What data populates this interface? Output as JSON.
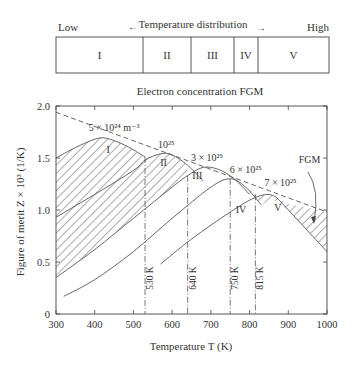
{
  "top_bar": {
    "low_label": "Low",
    "high_label": "High",
    "title": "Temperature distribution",
    "left_arrow": "←",
    "right_arrow": "→",
    "segments": [
      {
        "label": "I",
        "x0": 56,
        "x1": 143
      },
      {
        "label": "II",
        "x0": 143,
        "x1": 191
      },
      {
        "label": "III",
        "x0": 191,
        "x1": 234
      },
      {
        "label": "IV",
        "x0": 234,
        "x1": 258
      },
      {
        "label": "V",
        "x0": 258,
        "x1": 329
      }
    ]
  },
  "subtitle": "Electron concentration FGM",
  "chart_data": {
    "type": "line",
    "title": "Electron concentration FGM",
    "xlabel": "Temperature T (K)",
    "ylabel": "Figure of merit Z × 10³ (1/K)",
    "xlim": [
      300,
      1000
    ],
    "ylim": [
      0,
      2.0
    ],
    "x_ticks": [
      300,
      400,
      500,
      600,
      700,
      800,
      900,
      1000
    ],
    "y_ticks": [
      0,
      0.5,
      1.0,
      1.5,
      2.0
    ],
    "y_tick_labels": [
      "0",
      "0.5",
      "1.0",
      "1.5",
      "2.0"
    ],
    "grid": false,
    "series": [
      {
        "name": "5×10^24 m^-3",
        "segment": "I",
        "x": [
          300,
          350,
          400,
          430,
          480,
          530
        ],
        "y": [
          1.5,
          1.6,
          1.68,
          1.69,
          1.62,
          1.51
        ]
      },
      {
        "name": "10^25",
        "segment": "II",
        "x": [
          300,
          400,
          500,
          530,
          570,
          600,
          640,
          680
        ],
        "y": [
          0.93,
          1.15,
          1.38,
          1.48,
          1.54,
          1.53,
          1.43,
          1.28
        ]
      },
      {
        "name": "3×10^25",
        "segment": "III",
        "x": [
          300,
          400,
          500,
          600,
          640,
          680,
          720,
          760,
          800
        ],
        "y": [
          0.35,
          0.62,
          0.92,
          1.22,
          1.33,
          1.41,
          1.39,
          1.3,
          1.15
        ]
      },
      {
        "name": "6×10^25",
        "segment": "IV",
        "x": [
          320,
          400,
          500,
          600,
          700,
          750,
          790,
          830
        ],
        "y": [
          0.17,
          0.33,
          0.6,
          0.92,
          1.22,
          1.3,
          1.22,
          1.05
        ]
      },
      {
        "name": "7×10^25",
        "segment": "V",
        "x": [
          570,
          650,
          750,
          815,
          860,
          900,
          950,
          1000
        ],
        "y": [
          0.48,
          0.72,
          0.98,
          1.12,
          1.14,
          1.0,
          0.8,
          0.6
        ]
      },
      {
        "name": "FGM",
        "style": "dashed",
        "x": [
          300,
          1000
        ],
        "y": [
          1.94,
          0.98
        ]
      }
    ],
    "boundaries": [
      {
        "label": "530 K",
        "x": 530
      },
      {
        "label": "640 K",
        "x": 640
      },
      {
        "label": "750 K",
        "x": 750
      },
      {
        "label": "815 K",
        "x": 815
      }
    ],
    "annotations": [
      {
        "text": "5 × 10²⁴ m⁻³",
        "x": 450,
        "y": 1.76
      },
      {
        "text": "10²⁵",
        "x": 585,
        "y": 1.6
      },
      {
        "text": "3 × 10²⁵",
        "x": 690,
        "y": 1.47
      },
      {
        "text": "6 × 10²⁵",
        "x": 790,
        "y": 1.36
      },
      {
        "text": "7 × 10²⁵",
        "x": 880,
        "y": 1.23
      },
      {
        "text": "FGM",
        "x": 955,
        "y": 1.45
      },
      {
        "text": "I",
        "x": 435,
        "y": 1.55
      },
      {
        "text": "II",
        "x": 578,
        "y": 1.42
      },
      {
        "text": "III",
        "x": 665,
        "y": 1.3
      },
      {
        "text": "IV",
        "x": 778,
        "y": 0.97
      },
      {
        "text": "V",
        "x": 873,
        "y": 0.99
      }
    ]
  }
}
